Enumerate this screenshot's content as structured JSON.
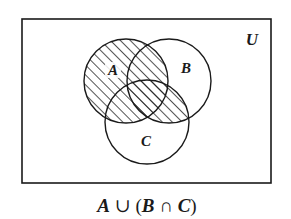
{
  "diagram": {
    "type": "venn",
    "universe": {
      "label": "U",
      "rect": {
        "x": 22,
        "y": 19,
        "width": 249,
        "height": 164
      }
    },
    "sets": [
      {
        "id": "A",
        "label": "A",
        "cx": 126,
        "cy": 81,
        "r": 42,
        "label_x": 113,
        "label_y": 75
      },
      {
        "id": "B",
        "label": "B",
        "cx": 169,
        "cy": 81,
        "r": 42,
        "label_x": 186,
        "label_y": 73
      },
      {
        "id": "C",
        "label": "C",
        "cx": 147,
        "cy": 122,
        "r": 42,
        "label_x": 146,
        "label_y": 146
      }
    ],
    "shaded_region": "A ∪ (B ∩ C)",
    "shading_style": "diagonal-hatch",
    "caption": {
      "full": "A ∪ (B ∩ C)",
      "parts": [
        "A",
        " ∪ (",
        "B",
        " ∩ ",
        "C",
        ")"
      ]
    },
    "colors": {
      "stroke": "#1a1a1a",
      "background": "#ffffff"
    }
  }
}
